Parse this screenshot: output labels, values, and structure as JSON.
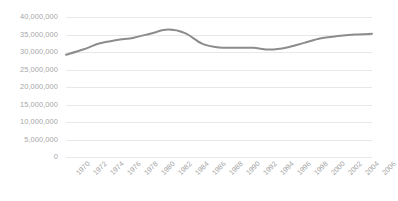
{
  "chart_data": {
    "type": "line",
    "title": "",
    "subtitle": "",
    "xlabel": "",
    "ylabel": "",
    "ylim": [
      0,
      40000000
    ],
    "ytick_values": [
      0,
      5000000,
      10000000,
      15000000,
      20000000,
      25000000,
      30000000,
      35000000,
      40000000
    ],
    "ytick_labels": [
      "0",
      "5,000,000",
      "10,000,000",
      "15,000,000",
      "20,000,000",
      "25,000,000",
      "30,000,000",
      "35,000,000",
      "40,000,000"
    ],
    "categories": [
      1970,
      1972,
      1974,
      1976,
      1978,
      1980,
      1982,
      1984,
      1986,
      1988,
      1990,
      1992,
      1994,
      1996,
      1998,
      2000,
      2002,
      2004,
      2006
    ],
    "xtick_labels": [
      "1970",
      "1972",
      "1974",
      "1976",
      "1978",
      "1980",
      "1982",
      "1984",
      "1986",
      "1988",
      "1990",
      "1992",
      "1994",
      "1996",
      "1998",
      "2000",
      "2002",
      "2004",
      "2006"
    ],
    "xlim": [
      1970,
      2006
    ],
    "values": [
      29200000,
      30700000,
      32500000,
      33400000,
      34100000,
      35300000,
      36400000,
      35400000,
      32400000,
      31300000,
      31200000,
      31200000,
      30700000,
      31300000,
      32600000,
      33900000,
      34600000,
      35000000,
      35200000
    ],
    "series": [
      {
        "name": "series-1",
        "color": "#8c8c8c",
        "values": [
          29200000,
          30700000,
          32500000,
          33400000,
          34100000,
          35300000,
          36400000,
          35400000,
          32400000,
          31300000,
          31200000,
          31200000,
          30700000,
          31300000,
          32600000,
          33900000,
          34600000,
          35000000,
          35200000
        ]
      }
    ],
    "grid": {
      "horizontal": true,
      "vertical": false,
      "color": "#e8e8e8"
    },
    "legend": {
      "visible": false,
      "position": "none",
      "entries": []
    },
    "annotations": [],
    "colors": {
      "line": "#8c8c8c",
      "gridline": "#e8e8e8",
      "tick_label": "#a6a6a6",
      "background": "#ffffff"
    }
  }
}
